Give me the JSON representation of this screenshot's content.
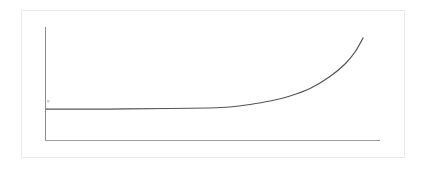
{
  "figure": {
    "title": "",
    "background_color": "#ffffff",
    "frame": {
      "border_color": "#e9e9e9",
      "x": 21,
      "y": 10,
      "width": 384,
      "height": 148
    }
  },
  "axes": {
    "axis_color": "#8d8d8d",
    "x_axis_color": "#9a9a9a",
    "origin_x": 45,
    "baseline_y": 140,
    "y_axis_top": 27,
    "x_axis_right": 380,
    "tick_mark": {
      "x": 48,
      "y": 101,
      "size": 2,
      "color": "#cfcfcf"
    }
  },
  "chart_data": {
    "type": "line",
    "title": "",
    "xlabel": "",
    "ylabel": "",
    "xlim": [
      0,
      100
    ],
    "ylim": [
      0,
      100
    ],
    "grid": false,
    "legend": null,
    "annotations": [],
    "series": [
      {
        "name": "exponential-growth",
        "color": "#555555",
        "x": [
          0,
          10,
          20,
          30,
          40,
          50,
          55,
          60,
          65,
          70,
          75,
          80,
          85,
          90,
          95,
          100
        ],
        "values": [
          27.4,
          27.5,
          27.7,
          28.1,
          28.8,
          30.5,
          32.0,
          34.3,
          37.6,
          42.0,
          47.6,
          54.5,
          62.6,
          71.8,
          81.8,
          90.3
        ]
      }
    ],
    "pixel_path": {
      "start": [
        46,
        109
      ],
      "end": [
        363,
        38
      ],
      "flat_until_x": 210,
      "samples": [
        [
          46,
          109
        ],
        [
          110,
          109
        ],
        [
          170,
          108.5
        ],
        [
          210,
          108
        ],
        [
          230,
          107
        ],
        [
          250,
          104.5
        ],
        [
          270,
          101
        ],
        [
          290,
          96
        ],
        [
          310,
          88.5
        ],
        [
          330,
          76.5
        ],
        [
          345,
          64
        ],
        [
          355,
          52
        ],
        [
          363,
          38
        ]
      ]
    }
  },
  "accessibility": {
    "description": "Exponential growth curve on plain x and y axes"
  }
}
